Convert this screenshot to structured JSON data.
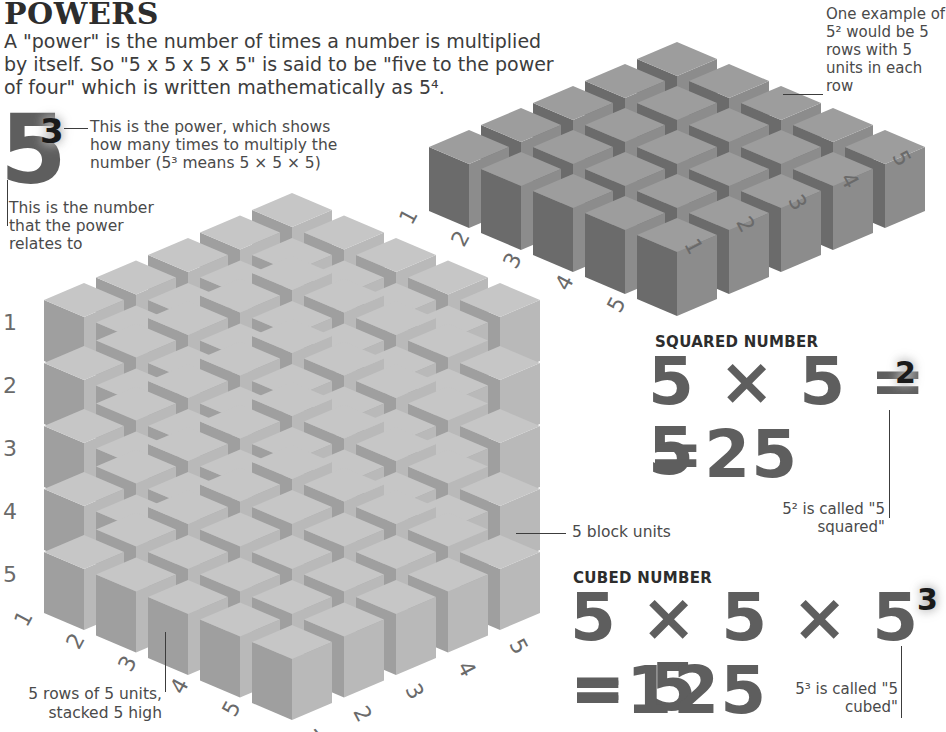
{
  "header": {
    "title": "POWERS",
    "intro": "A \"power\" is the number of times a number is multiplied by itself. So \"5 x 5 x 5 x 5\" is said to be \"five to the power of four\" which is written mathematically as 5⁴."
  },
  "notation_example": {
    "base": "5",
    "exponent": "3",
    "power_note": "This is the power, which shows how many times to multiply the number (5³ means 5 × 5 × 5)",
    "number_note": "This is the number that the power relates to"
  },
  "square_grid": {
    "note": "One example of 5² would be 5 rows with 5 units in each row",
    "rows": 5,
    "cols": 5,
    "left_axis_labels": [
      "1",
      "2",
      "3",
      "4",
      "5"
    ],
    "right_axis_labels": [
      "1",
      "2",
      "3",
      "4",
      "5"
    ],
    "colors": {
      "top": "#9d9d9d",
      "left": "#6b6b6b",
      "right": "#8c8c8c"
    },
    "origin": {
      "x": 677,
      "y": 42
    },
    "step": {
      "dx": 52,
      "dy": 22
    },
    "cube": {
      "half_w": 40,
      "half_h": 17,
      "height": 64
    }
  },
  "cube_block": {
    "layers": 5,
    "rows": 5,
    "cols": 5,
    "layer_labels": [
      "1",
      "2",
      "3",
      "4",
      "5"
    ],
    "left_axis_labels": [
      "1",
      "2",
      "3",
      "4",
      "5"
    ],
    "right_axis_labels": [
      "1",
      "2",
      "3",
      "4",
      "5"
    ],
    "colors": {
      "top": "#c6c6c6",
      "left": "#9f9f9f",
      "right": "#b9b9b9"
    },
    "origin": {
      "x": 292,
      "y": 193
    },
    "step": {
      "dx": 52,
      "dy": 22.5,
      "layer": 63
    },
    "cube": {
      "half_w": 40,
      "half_h": 17,
      "height": 61
    },
    "block_units_note": "5 block units",
    "rows_note": "5 rows of 5 units, stacked 5 high"
  },
  "squared": {
    "heading": "SQUARED NUMBER",
    "expression": "5 × 5 = 5",
    "exponent": "2",
    "result": "=25",
    "note": "5² is called \"5 squared\""
  },
  "cubed": {
    "heading": "CUBED NUMBER",
    "expression": "5 × 5 × 5 = 5",
    "exponent": "3",
    "result": "=125",
    "note": "5³ is called \"5 cubed\""
  }
}
